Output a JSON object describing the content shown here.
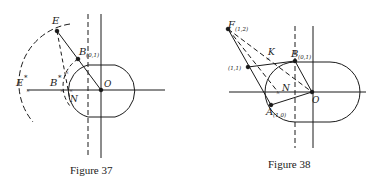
{
  "figures": [
    {
      "id": "fig37",
      "caption": "Figure 37",
      "labels": {
        "E": "E",
        "E_star": "E",
        "E_star_sup": "*",
        "B": "B",
        "B_sub": "(0,1)",
        "B_star": "B",
        "B_star_sup": "*",
        "N": "N",
        "O": "O"
      }
    },
    {
      "id": "fig38",
      "caption": "Figure 38",
      "labels": {
        "F": "F",
        "F_sub": "(1,2)",
        "K": "K",
        "B": "B",
        "B_sub": "(0,1)",
        "P11": "(1,1)",
        "N": "N",
        "O": "O",
        "A": "A",
        "A_sub": "(1,0)"
      }
    }
  ],
  "colors": {
    "ink": "#1a1a1a",
    "background": "#ffffff"
  }
}
